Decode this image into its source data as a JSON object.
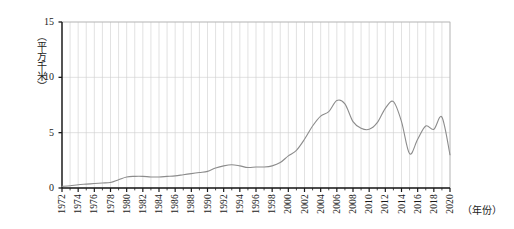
{
  "chart_data": {
    "type": "line",
    "title": "",
    "xlabel": "（年份）",
    "ylabel": "（平方千米）",
    "ylim": [
      0,
      15
    ],
    "yticks": [
      0,
      5,
      10,
      15
    ],
    "xlim": [
      1972,
      2020
    ],
    "grid": true,
    "grid_x_step": 1,
    "legend": "none",
    "line_color": "#8c8c8c",
    "axis_color": "#1a1a1a",
    "grid_color": "#cfcfcf",
    "xtick_labels": [
      "1972",
      "1974",
      "1976",
      "1978",
      "1980",
      "1982",
      "1984",
      "1986",
      "1988",
      "1990",
      "1992",
      "1994",
      "1996",
      "1998",
      "2000",
      "2002",
      "2004",
      "2006",
      "2008",
      "2010",
      "2012",
      "2014",
      "2016",
      "2018",
      "2020"
    ],
    "x": [
      1972,
      1973,
      1974,
      1975,
      1976,
      1977,
      1978,
      1979,
      1980,
      1981,
      1982,
      1983,
      1984,
      1985,
      1986,
      1987,
      1988,
      1989,
      1990,
      1991,
      1992,
      1993,
      1994,
      1995,
      1996,
      1997,
      1998,
      1999,
      2000,
      2001,
      2002,
      2003,
      2004,
      2005,
      2006,
      2007,
      2008,
      2009,
      2010,
      2011,
      2012,
      2013,
      2014,
      2015,
      2016,
      2017,
      2018,
      2019,
      2020
    ],
    "values": [
      0.15,
      0.2,
      0.3,
      0.35,
      0.4,
      0.45,
      0.5,
      0.75,
      1.0,
      1.05,
      1.05,
      1.0,
      1.0,
      1.05,
      1.1,
      1.2,
      1.3,
      1.4,
      1.5,
      1.8,
      2.0,
      2.1,
      2.0,
      1.85,
      1.9,
      1.9,
      2.0,
      2.3,
      2.9,
      3.4,
      4.4,
      5.6,
      6.5,
      6.9,
      7.9,
      7.6,
      6.0,
      5.4,
      5.3,
      5.9,
      7.2,
      7.8,
      6.0,
      3.1,
      4.4,
      5.6,
      5.3,
      6.4,
      3.0
    ]
  }
}
